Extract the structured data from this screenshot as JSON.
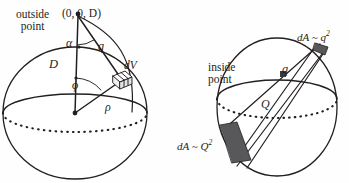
{
  "figure": {
    "caption": "",
    "background_color": "#fefefe",
    "ink_color": "#231f20",
    "shade_color": "#58585a"
  },
  "panels": [
    {
      "id": "outside",
      "name": "outside-point-sphere-diagram",
      "labels": {
        "outside_point_line1": "outside",
        "outside_point_line2": "point",
        "apex_coordinates": "(0, 0, D)",
        "alpha": "α",
        "q": "q",
        "D": "D",
        "dV": "dV",
        "phi": "ϕ",
        "rho": "ρ"
      },
      "geometry": {
        "sphere_center_x": 75,
        "sphere_center_y": 113,
        "sphere_radius_x": 72,
        "sphere_radius_y": 66,
        "apex_x": 78,
        "apex_y": 14,
        "equator_ry": 19
      }
    },
    {
      "id": "inside",
      "name": "inside-point-sphere-diagram",
      "labels": {
        "inside_point_line1": "inside",
        "inside_point_line2": "point",
        "dA_near_prefix": "dA ~ q",
        "dA_near_exponent": "2",
        "dA_far_prefix": "dA ~ Q",
        "dA_far_exponent": "2",
        "q": "q",
        "Q": "Q"
      },
      "geometry": {
        "sphere_center_x": 102,
        "sphere_center_y": 107,
        "sphere_radius_x": 60,
        "sphere_radius_y": 69,
        "interior_point_x": 108,
        "interior_point_y": 74,
        "equator_ry": 19
      }
    }
  ]
}
